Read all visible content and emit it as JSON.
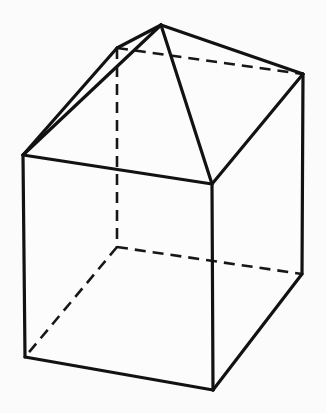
{
  "figure": {
    "description": "Line drawing of a rectangular prism (cube) topped by a pyramid-like roof, shown in oblique projection with hidden edges dashed.",
    "style": {
      "background_color": "#fbfbfc",
      "solid_edge_color": "#121212",
      "hidden_edge_color": "#171717",
      "face_fill_color": "#fcfcfd",
      "solid_edge_width": 3.2,
      "hidden_edge_width": 2.6,
      "hidden_dash_pattern": "11 7"
    },
    "vertices": {
      "apex": {
        "name": "roof-apex",
        "x": 161,
        "y": 25
      },
      "roof_back_left": {
        "name": "roof-back-left",
        "x": 117,
        "y": 48
      },
      "roof_right": {
        "name": "roof-right-ridge-end",
        "x": 303,
        "y": 74
      },
      "top_left": {
        "name": "box-top-back-left",
        "x": 23,
        "y": 155
      },
      "top_front": {
        "name": "box-top-front",
        "x": 212,
        "y": 184
      },
      "top_back_hidden": {
        "name": "box-top-hidden-back",
        "x": 117,
        "y": 48
      },
      "bottom_left": {
        "name": "box-bottom-left",
        "x": 25,
        "y": 357
      },
      "bottom_front": {
        "name": "box-bottom-front",
        "x": 213,
        "y": 390
      },
      "bottom_right": {
        "name": "box-bottom-right",
        "x": 302,
        "y": 274
      },
      "bottom_back_hidden": {
        "name": "box-bottom-hidden-back",
        "x": 117,
        "y": 247
      }
    },
    "edges_solid": [
      {
        "name": "apex-to-top-left",
        "from": "apex",
        "to": "top_left"
      },
      {
        "name": "apex-to-roof-back-left",
        "from": "apex",
        "to": "roof_back_left"
      },
      {
        "name": "roof-back-left-to-top-left",
        "from": "roof_back_left",
        "to": "top_left"
      },
      {
        "name": "apex-to-roof-right",
        "from": "apex",
        "to": "roof_right"
      },
      {
        "name": "apex-to-top-front",
        "from": "apex",
        "to": "top_front"
      },
      {
        "name": "roof-right-to-top-front",
        "from": "roof_right",
        "to": "top_front"
      },
      {
        "name": "top-left-to-top-front",
        "from": "top_left",
        "to": "top_front"
      },
      {
        "name": "roof-right-to-bottom-right",
        "from": "roof_right",
        "to": "bottom_right"
      },
      {
        "name": "top-left-to-bottom-left",
        "from": "top_left",
        "to": "bottom_left"
      },
      {
        "name": "top-front-to-bottom-front",
        "from": "top_front",
        "to": "bottom_front"
      },
      {
        "name": "bottom-left-to-bottom-front",
        "from": "bottom_left",
        "to": "bottom_front"
      },
      {
        "name": "bottom-front-to-bottom-right",
        "from": "bottom_front",
        "to": "bottom_right"
      }
    ],
    "edges_hidden": [
      {
        "name": "roof-ridge-hidden",
        "from": "roof_back_left",
        "to": "roof_right"
      },
      {
        "name": "box-back-vertical-hidden",
        "from": "top_back_hidden",
        "to": "bottom_back_hidden"
      },
      {
        "name": "box-bottom-back-right-hidden",
        "from": "bottom_back_hidden",
        "to": "bottom_right"
      },
      {
        "name": "box-bottom-back-left-hidden",
        "from": "bottom_back_hidden",
        "to": "bottom_left"
      }
    ],
    "labels": []
  }
}
